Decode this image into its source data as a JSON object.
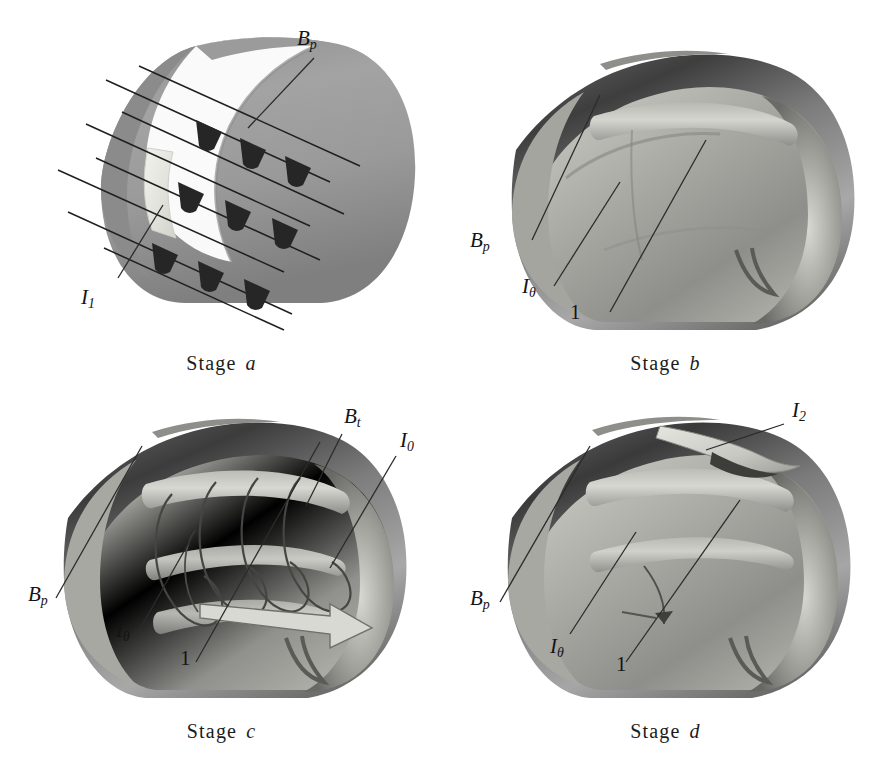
{
  "figure": {
    "background_color": "#ffffff",
    "ink_color": "#1a1a1a"
  },
  "panels": [
    {
      "id": "a",
      "caption_word": "Stage",
      "caption_letter": "a",
      "labels": [
        {
          "name": "poloidal-field",
          "text": "B",
          "sub": "p"
        },
        {
          "name": "current-I1",
          "text": "I",
          "sub": "1"
        }
      ],
      "features": {
        "field_line_count": 8,
        "arrowhead_count": 9,
        "cut_away": true,
        "body_tone": "#9a9a9a",
        "shadow_tone": "#7c7c7c",
        "highlight_tone": "#eeeeea"
      }
    },
    {
      "id": "b",
      "caption_word": "Stage",
      "caption_letter": "b",
      "labels": [
        {
          "name": "poloidal-field",
          "text": "B",
          "sub": "p"
        },
        {
          "name": "theta-current",
          "text": "I",
          "sub": "θ"
        },
        {
          "name": "region-one",
          "text": "1",
          "sub": ""
        }
      ],
      "features": {
        "cut_away": true,
        "body_tone": "#9e9e9e",
        "shadow_tone": "#6d6d6d",
        "highlight_tone": "#d6d6d2"
      }
    },
    {
      "id": "c",
      "caption_word": "Stage",
      "caption_letter": "c",
      "labels": [
        {
          "name": "toroidal-field",
          "text": "B",
          "sub": "t"
        },
        {
          "name": "axial-current",
          "text": "I",
          "sub": "0"
        },
        {
          "name": "poloidal-field",
          "text": "B",
          "sub": "p"
        },
        {
          "name": "theta-current",
          "text": "I",
          "sub": "θ"
        },
        {
          "name": "region-one",
          "text": "1",
          "sub": ""
        }
      ],
      "features": {
        "cut_away": true,
        "helical_field_lines": 5,
        "axial_arrow": true,
        "body_tone": "#9e9e9e",
        "shadow_tone": "#6d6d6d",
        "highlight_tone": "#d6d6d2"
      }
    },
    {
      "id": "d",
      "caption_word": "Stage",
      "caption_letter": "d",
      "labels": [
        {
          "name": "current-I2",
          "text": "I",
          "sub": "2"
        },
        {
          "name": "poloidal-field",
          "text": "B",
          "sub": "p"
        },
        {
          "name": "theta-current",
          "text": "I",
          "sub": "θ"
        },
        {
          "name": "region-one",
          "text": "1",
          "sub": ""
        }
      ],
      "features": {
        "cut_away": true,
        "escaping_current_sheet": true,
        "body_tone": "#9e9e9e",
        "shadow_tone": "#6d6d6d",
        "highlight_tone": "#d6d6d2"
      }
    }
  ]
}
